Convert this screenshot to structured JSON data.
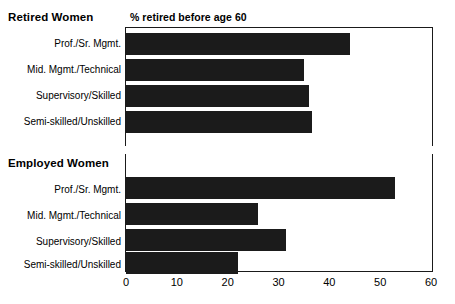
{
  "chart_data": {
    "type": "bar",
    "title": "",
    "orientation": "horizontal",
    "xlabel": "",
    "ylabel": "",
    "xlim": [
      0,
      60
    ],
    "xticks": [
      0,
      10,
      20,
      30,
      40,
      50,
      60
    ],
    "grid": false,
    "legend": "none",
    "categories": [
      "Prof./Sr. Mgmt.",
      "Mid. Mgmt./Technical",
      "Supervisory/Skilled",
      "Semi-skilled/Unskilled"
    ],
    "panels": [
      {
        "group_label": "Retired Women",
        "series_title": "% retired before age 60",
        "values": [
          44,
          35,
          36,
          36.5
        ]
      },
      {
        "group_label": "Employed Women",
        "series_title": "% expecting to retire before age 60",
        "values": [
          53,
          26,
          31.5,
          22
        ]
      }
    ],
    "bar_color": "#1b1b1b",
    "background_color": "#ffffff"
  }
}
